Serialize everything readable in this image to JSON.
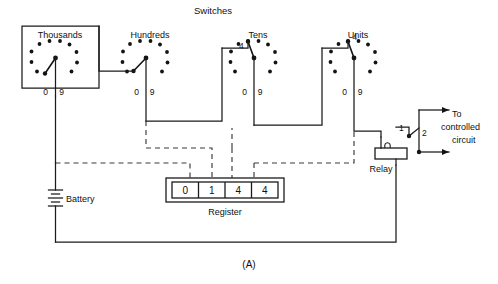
{
  "figure": {
    "caption": "(A)",
    "title": "Switches"
  },
  "switches": [
    {
      "name": "thousands",
      "label": "Thousands",
      "low_digit": "0",
      "high_digit": "9",
      "selected_label": "",
      "selected_position": 0
    },
    {
      "name": "hundreds",
      "label": "Hundreds",
      "low_digit": "0",
      "high_digit": "9",
      "selected_label": "",
      "selected_position": 1
    },
    {
      "name": "tens",
      "label": "Tens",
      "low_digit": "0",
      "high_digit": "9",
      "selected_label": "4",
      "selected_position": 4
    },
    {
      "name": "units",
      "label": "Units",
      "low_digit": "0",
      "high_digit": "9",
      "selected_label": "4",
      "selected_position": 4
    }
  ],
  "register": {
    "label": "Register",
    "digits": [
      "0",
      "1",
      "4",
      "4"
    ]
  },
  "battery": {
    "label": "Battery"
  },
  "relay": {
    "label": "Relay",
    "contact_1": "1",
    "contact_2": "2"
  },
  "output": {
    "line1": "To",
    "line2": "controlled",
    "line3": "circuit"
  },
  "colors": {
    "ink": "#141414",
    "dashed": "#3a3a3a",
    "background": "#ffffff"
  }
}
